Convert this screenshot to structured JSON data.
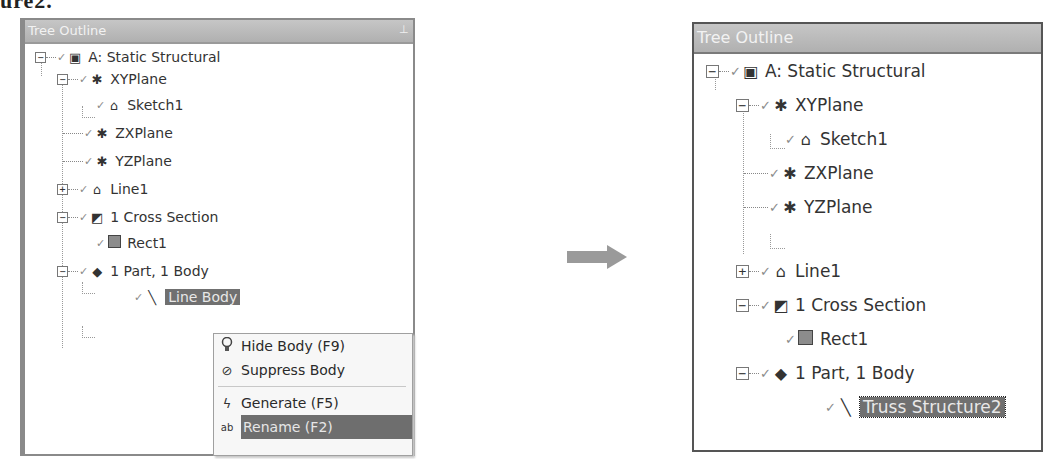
{
  "caption_fragment": "ure2.",
  "left_panel": {
    "title": "Tree Outline",
    "pin_icon": "pin-icon",
    "nodes": [
      {
        "label": "A: Static Structural",
        "toggle": "−",
        "icon": "static-structural-icon"
      },
      {
        "label": "XYPlane",
        "toggle": "−",
        "icon": "plane-icon"
      },
      {
        "label": "Sketch1",
        "toggle": "",
        "icon": "sketch-icon"
      },
      {
        "label": "ZXPlane",
        "toggle": "",
        "icon": "plane-icon"
      },
      {
        "label": "YZPlane",
        "toggle": "",
        "icon": "plane-icon"
      },
      {
        "label": "Line1",
        "toggle": "+",
        "icon": "line-sketch-icon"
      },
      {
        "label": "1 Cross Section",
        "toggle": "−",
        "icon": "cross-section-icon"
      },
      {
        "label": "Rect1",
        "toggle": "",
        "icon": "rectangle-icon"
      },
      {
        "label": "1 Part, 1 Body",
        "toggle": "−",
        "icon": "part-body-icon"
      },
      {
        "label": "Line Body",
        "toggle": "",
        "icon": "line-body-icon",
        "selected": true
      }
    ],
    "context_menu": {
      "items": [
        {
          "label": "Hide Body (F9)",
          "icon": "lightbulb-icon"
        },
        {
          "label": "Suppress Body",
          "icon": "suppress-icon"
        },
        {
          "label": "Generate (F5)",
          "icon": "lightning-icon"
        },
        {
          "label": "Rename (F2)",
          "icon": "rename-icon",
          "highlighted": true
        }
      ]
    }
  },
  "arrow": {
    "direction": "right",
    "color": "#9a9a9a"
  },
  "right_panel": {
    "title": "Tree Outline",
    "nodes": [
      {
        "label": "A: Static Structural",
        "toggle": "−"
      },
      {
        "label": "XYPlane",
        "toggle": "−"
      },
      {
        "label": "Sketch1",
        "toggle": ""
      },
      {
        "label": "ZXPlane",
        "toggle": ""
      },
      {
        "label": "YZPlane",
        "toggle": ""
      },
      {
        "label": "Line1",
        "toggle": "+"
      },
      {
        "label": "1 Cross Section",
        "toggle": "−"
      },
      {
        "label": "Rect1",
        "toggle": ""
      },
      {
        "label": "1 Part, 1 Body",
        "toggle": "−"
      },
      {
        "label": "Truss Structure2",
        "toggle": "",
        "selected": true
      }
    ]
  },
  "glyphs": {
    "check": "✓",
    "plane": "✱",
    "sketch": "⌂",
    "static": "▣",
    "cross": "◩",
    "part": "◆",
    "linebody": "╲",
    "bulb": "💡",
    "suppress": "⊘",
    "lightning": "ϟ",
    "rename": "ab",
    "pin": "⊥"
  }
}
